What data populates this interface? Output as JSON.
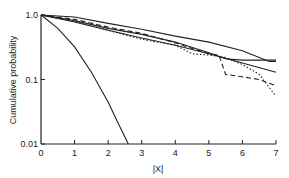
{
  "chart_data": {
    "type": "line",
    "title": "",
    "xlabel": "|X|",
    "ylabel": "Cumulative probability",
    "xlim": [
      0,
      7
    ],
    "ylim": [
      0.01,
      1.0
    ],
    "yscale": "log",
    "grid": false,
    "legend": null,
    "x_ticks": [
      "0",
      "1",
      "2",
      "3",
      "4",
      "5",
      "6",
      "7"
    ],
    "y_ticks": [
      "1.0",
      "0.1",
      "0.01"
    ],
    "series": [
      {
        "name": "gaussian",
        "style": "solid",
        "x": [
          0,
          0.5,
          1,
          1.5,
          2,
          2.3,
          2.6
        ],
        "y": [
          1.0,
          0.62,
          0.32,
          0.13,
          0.045,
          0.021,
          0.01
        ]
      },
      {
        "name": "empirical-upper",
        "style": "solid",
        "x": [
          0,
          1,
          2,
          3,
          4,
          5,
          6,
          6.8,
          7
        ],
        "y": [
          1.0,
          0.93,
          0.74,
          0.6,
          0.47,
          0.38,
          0.28,
          0.19,
          0.19
        ]
      },
      {
        "name": "empirical-solid-2",
        "style": "solid",
        "x": [
          0,
          1,
          2,
          3,
          4,
          5,
          5.5,
          6,
          7
        ],
        "y": [
          1.0,
          0.82,
          0.62,
          0.5,
          0.38,
          0.26,
          0.21,
          0.2,
          0.2
        ]
      },
      {
        "name": "power-law-fit",
        "style": "solid",
        "x": [
          0,
          1,
          2,
          3,
          4,
          5,
          6,
          7
        ],
        "y": [
          1.0,
          0.78,
          0.58,
          0.44,
          0.34,
          0.25,
          0.18,
          0.13
        ]
      },
      {
        "name": "empirical-dashed",
        "style": "dashed",
        "x": [
          0,
          1,
          2,
          3,
          4,
          5,
          5.3,
          5.5,
          6,
          6.5,
          7
        ],
        "y": [
          1.0,
          0.86,
          0.65,
          0.52,
          0.37,
          0.25,
          0.24,
          0.12,
          0.11,
          0.1,
          0.08
        ]
      },
      {
        "name": "empirical-dotted",
        "style": "dotted",
        "x": [
          0,
          1,
          2,
          3,
          4,
          4.5,
          5,
          5.5,
          6,
          6.5,
          7
        ],
        "y": [
          1.0,
          0.8,
          0.58,
          0.42,
          0.34,
          0.25,
          0.24,
          0.22,
          0.17,
          0.12,
          0.055
        ]
      }
    ]
  },
  "axes": {
    "ylabel": "Cumulative probability",
    "xlabel": "|X|",
    "x_ticks": [
      "0",
      "1",
      "2",
      "3",
      "4",
      "5",
      "6",
      "7"
    ],
    "y_ticks": [
      "1.0",
      "0.1",
      "0.01"
    ]
  }
}
